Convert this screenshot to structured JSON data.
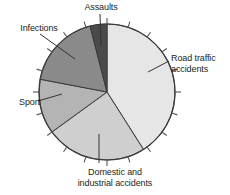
{
  "chart_data": {
    "type": "pie",
    "title": "",
    "subtitle": "",
    "xlabel": "",
    "ylabel": "",
    "legend_position": "none",
    "grid": false,
    "labels_on_slices": false,
    "start_angle_deg": 0,
    "direction": "clockwise",
    "categories": [
      "Road traffic accidents",
      "Domestic and industrial accidents",
      "Sport",
      "Infections",
      "Assaults"
    ],
    "values": [
      41,
      24,
      13,
      18,
      4
    ],
    "value_unit": "percent",
    "slice_angles_deg": [
      147.6,
      86.4,
      46.8,
      64.8,
      14.4
    ],
    "slice_boundaries_deg": [
      0,
      147.6,
      234.0,
      280.8,
      345.6,
      360
    ],
    "colors": [
      "#e6e6e6",
      "#cfcfcf",
      "#b4b4b4",
      "#8a8a8a",
      "#4a4a4a"
    ],
    "outline_color": "#3a3a3a",
    "tick_marks": {
      "present": true,
      "count": 20,
      "position": "outside-rim",
      "color": "#555555"
    },
    "leader_lines": {
      "present": true,
      "color": "#333333"
    }
  },
  "labels": {
    "assaults": "Assaults",
    "infections": "Infections",
    "sport": "Sport",
    "road_traffic_line1": "Road traffic",
    "road_traffic_line2": "accidents",
    "domestic_line1": "Domestic and",
    "domestic_line2": "industrial accidents"
  }
}
